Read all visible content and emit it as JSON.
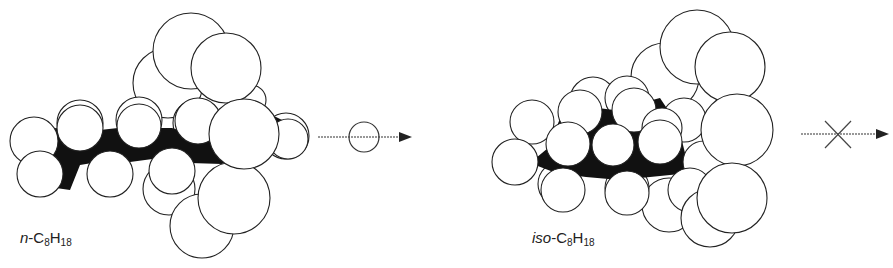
{
  "figure": {
    "panels": [
      {
        "id": "n-octane",
        "label_prefix": "n",
        "label_sep": "-C",
        "label_sub1": "8",
        "label_mid": "H",
        "label_sub2": "18",
        "arrow_marker": "circle",
        "passes": true
      },
      {
        "id": "iso-octane",
        "label_prefix": "iso",
        "label_sep": "-C",
        "label_sub1": "8",
        "label_mid": "H",
        "label_sub2": "18",
        "arrow_marker": "cross",
        "passes": false
      }
    ],
    "colors": {
      "atom_fill": "#ffffff",
      "atom_stroke": "#222222",
      "backbone": "#111111"
    }
  }
}
